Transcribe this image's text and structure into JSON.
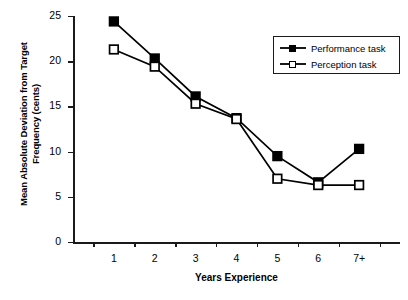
{
  "chart_data": {
    "type": "line",
    "title": "",
    "xlabel": "Years Experience",
    "ylabel": "Mean Absolute Deviation from Target Frequency (cents)",
    "ylabel_lines": [
      "Mean Absolute Deviation from Target",
      "Frequency (cents)"
    ],
    "categories": [
      "1",
      "2",
      "3",
      "4",
      "5",
      "6",
      "7+"
    ],
    "xlim": [
      0,
      8
    ],
    "ylim": [
      0,
      25
    ],
    "yticks": [
      0,
      5,
      10,
      15,
      20,
      25
    ],
    "ytick_labels": [
      "0",
      "5",
      "10",
      "15",
      "20",
      "25"
    ],
    "grid": false,
    "legend_position": "top-right",
    "series": [
      {
        "name": "Performance task",
        "marker": "filled-square",
        "color": "#000000",
        "values": [
          24.4,
          20.3,
          16.1,
          13.7,
          9.5,
          6.6,
          10.3
        ]
      },
      {
        "name": "Perception task",
        "marker": "open-square",
        "color": "#000000",
        "values": [
          21.3,
          19.4,
          15.3,
          13.6,
          7.0,
          6.3,
          6.3
        ]
      }
    ]
  },
  "legend": {
    "items": [
      {
        "label": "Performance task",
        "marker": "filled-square"
      },
      {
        "label": "Perception task",
        "marker": "open-square"
      }
    ]
  },
  "caption": {
    "text": ""
  }
}
